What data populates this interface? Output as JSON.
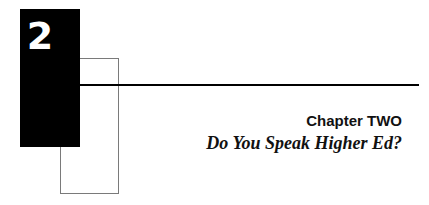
{
  "chapter": {
    "number": "2",
    "label": "Chapter TWO",
    "title": "Do You Speak Higher Ed?"
  }
}
